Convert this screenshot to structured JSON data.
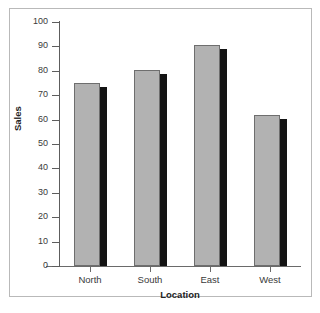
{
  "chart_data": {
    "type": "bar",
    "title": "",
    "subtitle": "",
    "categories": [
      "North",
      "South",
      "East",
      "West"
    ],
    "values": [
      75,
      80.5,
      90.5,
      62
    ],
    "series": [
      {
        "name": "Sales",
        "values": [
          75,
          80.5,
          90.5,
          62
        ]
      }
    ],
    "xlabel": "Location",
    "ylabel": "Sales",
    "ylim": [
      0,
      100
    ],
    "yticks": [
      0,
      10,
      20,
      30,
      40,
      50,
      60,
      70,
      80,
      90,
      100
    ],
    "ytick_labels": [
      "0",
      "10",
      "20",
      "30",
      "40",
      "50",
      "60",
      "70",
      "80",
      "90",
      "100"
    ],
    "grid": false,
    "legend": false,
    "legend_position": "none",
    "bar_style": "3d-shadow",
    "colors": {
      "bar_face": "#b2b2b2",
      "bar_edge": "#6e6e6e",
      "bar_shadow": "#141414",
      "axis": "#5d5d5d",
      "frame": "#b9b9b9",
      "text": "#3a3a3a",
      "background": "#ffffff"
    }
  }
}
